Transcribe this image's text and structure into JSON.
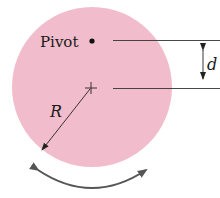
{
  "diagram": {
    "type": "physical-pendulum",
    "labels": {
      "pivot": "Pivot",
      "radius": "R",
      "distance": "d"
    },
    "colors": {
      "disk": "#f1bccb",
      "ink": "#222222",
      "arrow": "#555555"
    },
    "elements": [
      {
        "kind": "disk",
        "description": "Uniform solid disk"
      },
      {
        "kind": "point",
        "description": "Pivot point above center"
      },
      {
        "kind": "cross",
        "description": "Center of disk"
      },
      {
        "kind": "arrow",
        "description": "Radius R from center to edge"
      },
      {
        "kind": "dimension",
        "description": "Distance d between pivot and center"
      },
      {
        "kind": "curved-arrow",
        "description": "Oscillation direction"
      }
    ]
  }
}
